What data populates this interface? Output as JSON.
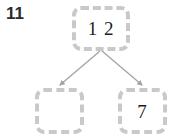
{
  "page": {
    "background_color": "#ffffff",
    "width": 170,
    "height": 137
  },
  "problem": {
    "number_label": "11",
    "number_color": "#2b2b2b"
  },
  "diagram": {
    "type": "number-bond-tree",
    "box_border_color": "#c9c9c9",
    "box_border_style": "dashed",
    "box_fill_color": "#ffffff",
    "arrow_color": "#a0a0a0",
    "parent": {
      "value": "1 2",
      "is_blank": false
    },
    "children": [
      {
        "value": "",
        "is_blank": true,
        "position": "left"
      },
      {
        "value": "7",
        "is_blank": false,
        "position": "right"
      }
    ],
    "connectors": [
      {
        "name": "arrow-to-left-child",
        "from": "parent",
        "to": "child-left"
      },
      {
        "name": "arrow-to-right-child",
        "from": "parent",
        "to": "child-right"
      }
    ]
  }
}
